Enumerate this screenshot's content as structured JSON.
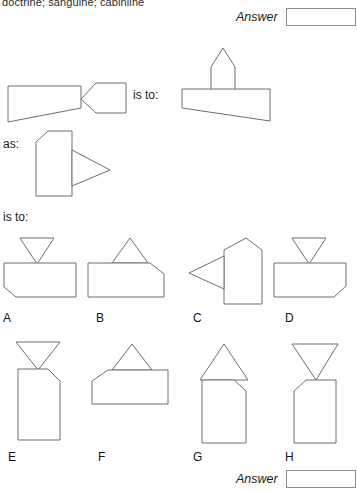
{
  "header": {
    "clipped_text": "doctrine; sanguine; cabinline"
  },
  "answer_top": {
    "label": "Answer",
    "value": "",
    "placeholder": ""
  },
  "answer_bottom": {
    "label": "Answer",
    "value": "",
    "placeholder": ""
  },
  "relations": {
    "is_to_first": "is to:",
    "as": "as:",
    "is_to_second": "is to:"
  },
  "analogy": {
    "stem_a_name": "quadrilateral-with-left-pointing-pentagon",
    "stem_b_name": "house-pentagon-above-quadrilateral",
    "stem_c_name": "clipped-corner-rectangle-with-right-pointing-triangle"
  },
  "options": [
    {
      "letter": "A",
      "name": "rectangle-clipped-bottom-left-with-down-triangle"
    },
    {
      "letter": "B",
      "name": "rectangle-clipped-top-right-with-up-triangle"
    },
    {
      "letter": "C",
      "name": "rectangle-clipped-top-right-with-left-triangle"
    },
    {
      "letter": "D",
      "name": "rectangle-clipped-bottom-right-with-down-triangle"
    },
    {
      "letter": "E",
      "name": "tall-rectangle-clipped-top-right-with-down-triangle"
    },
    {
      "letter": "F",
      "name": "wide-rectangle-clipped-top-left-with-up-triangle"
    },
    {
      "letter": "G",
      "name": "tall-rectangle-clipped-top-right-with-up-triangle"
    },
    {
      "letter": "H",
      "name": "tall-rectangle-clipped-top-left-with-down-triangle"
    }
  ],
  "colors": {
    "stroke": "#6e6e6e",
    "fill": "#ffffff",
    "text": "#1a1a1a",
    "box_border": "#8d8d8d"
  }
}
